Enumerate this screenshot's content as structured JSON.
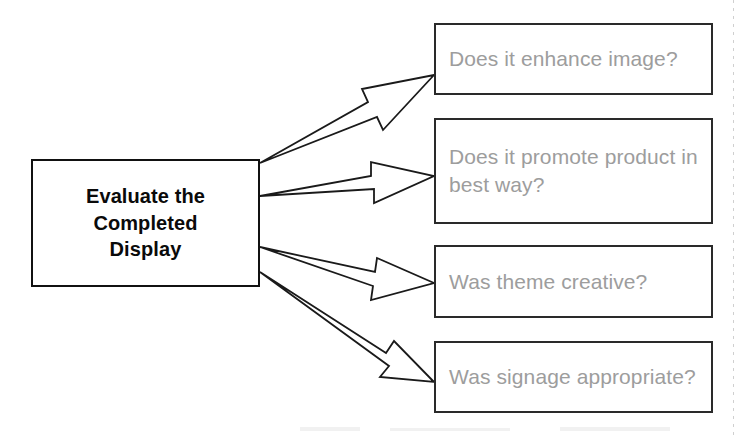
{
  "diagram": {
    "title": "Evaluate the Completed Display",
    "type": "flowchart",
    "orientation": "left-to-right",
    "background_color": "#ffffff",
    "source_node": {
      "id": "evaluate-display",
      "label": "Evaluate the\nCompleted\nDisplay",
      "text_color": "#0a0a0a",
      "border_color": "#111111",
      "fill_color": "#ffffff",
      "bold": true,
      "x": 31,
      "y": 159,
      "width": 229,
      "height": 128
    },
    "target_nodes": [
      {
        "id": "enhance-image",
        "label": "Does it enhance image?",
        "text_color": "#9d9d9d",
        "border_color": "#2a2a2a",
        "fill_color": "#ffffff",
        "x": 434,
        "y": 23,
        "width": 279,
        "height": 72
      },
      {
        "id": "promote-product",
        "label": "Does it promote product in\nbest way?",
        "text_color": "#9d9d9d",
        "border_color": "#2a2a2a",
        "fill_color": "#ffffff",
        "x": 434,
        "y": 118,
        "width": 279,
        "height": 106
      },
      {
        "id": "theme-creative",
        "label": "Was theme creative?",
        "text_color": "#9d9d9d",
        "border_color": "#2a2a2a",
        "fill_color": "#ffffff",
        "x": 434,
        "y": 245,
        "width": 279,
        "height": 73
      },
      {
        "id": "signage-appropriate",
        "label": "Was signage appropriate?",
        "text_color": "#9d9d9d",
        "border_color": "#2a2a2a",
        "fill_color": "#ffffff",
        "x": 434,
        "y": 341,
        "width": 279,
        "height": 72
      }
    ],
    "connectors": [
      {
        "id": "arrow-to-enhance-image",
        "style": "hollow-block-arrow",
        "stroke_color": "#1a1a1a",
        "fill_color": "#ffffff",
        "from": "evaluate-display",
        "to": "enhance-image",
        "from_point": [
          260,
          172
        ],
        "to_point": [
          434,
          75
        ]
      },
      {
        "id": "arrow-to-promote-product",
        "style": "hollow-block-arrow",
        "stroke_color": "#1a1a1a",
        "fill_color": "#ffffff",
        "from": "evaluate-display",
        "to": "promote-product",
        "from_point": [
          260,
          205
        ],
        "to_point": [
          434,
          176
        ]
      },
      {
        "id": "arrow-to-theme-creative",
        "style": "hollow-block-arrow",
        "stroke_color": "#1a1a1a",
        "fill_color": "#ffffff",
        "from": "evaluate-display",
        "to": "theme-creative",
        "from_point": [
          260,
          254
        ],
        "to_point": [
          434,
          283
        ]
      },
      {
        "id": "arrow-to-signage-appropriate",
        "style": "hollow-block-arrow",
        "stroke_color": "#1a1a1a",
        "fill_color": "#ffffff",
        "from": "evaluate-display",
        "to": "signage-appropriate",
        "from_point": [
          260,
          281
        ],
        "to_point": [
          434,
          382
        ]
      }
    ]
  }
}
